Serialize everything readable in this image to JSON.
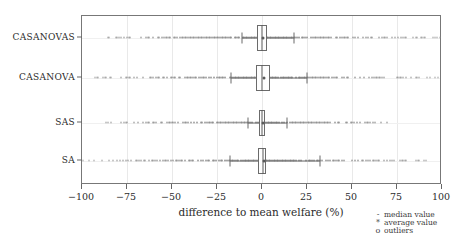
{
  "chart_data": {
    "type": "box",
    "title": "",
    "xlabel": "difference to mean welfare (%)",
    "ylabel": "",
    "xlim": [
      -100,
      100
    ],
    "xticks": [
      -100,
      -75,
      -50,
      -25,
      0,
      25,
      50,
      75,
      100
    ],
    "xticklabels": [
      "−100",
      "−75",
      "−50",
      "−25",
      "0",
      "25",
      "50",
      "75",
      "100"
    ],
    "categories": [
      "CASANOVAS",
      "CASANOVA",
      "SAS",
      "SA"
    ],
    "grid": true,
    "legend_position": "below-right-outside",
    "legend": [
      {
        "marker": "-",
        "label": "median value"
      },
      {
        "marker": "*",
        "label": "average value"
      },
      {
        "marker": "o",
        "label": "outliers"
      }
    ],
    "series": [
      {
        "name": "CASANOVAS",
        "q1": -3.0,
        "median": 0.0,
        "q3": 3.0,
        "mean": 0.5,
        "whisker_low": -11.0,
        "whisker_high": 18.0,
        "outlier_min": -88.0,
        "outlier_max": 100.0
      },
      {
        "name": "CASANOVA",
        "q1": -3.5,
        "median": 0.0,
        "q3": 4.5,
        "mean": 1.0,
        "whisker_low": -17.0,
        "whisker_high": 25.0,
        "outlier_min": -95.0,
        "outlier_max": 100.0
      },
      {
        "name": "SAS",
        "q1": -1.5,
        "median": 0.0,
        "q3": 1.5,
        "mean": 0.3,
        "whisker_low": -8.0,
        "whisker_high": 14.0,
        "outlier_min": -87.0,
        "outlier_max": 70.0
      },
      {
        "name": "SA",
        "q1": -2.0,
        "median": 0.5,
        "q3": 2.5,
        "mean": 1.0,
        "whisker_low": -18.0,
        "whisker_high": 32.0,
        "outlier_min": -100.0,
        "outlier_max": 93.0
      }
    ]
  }
}
